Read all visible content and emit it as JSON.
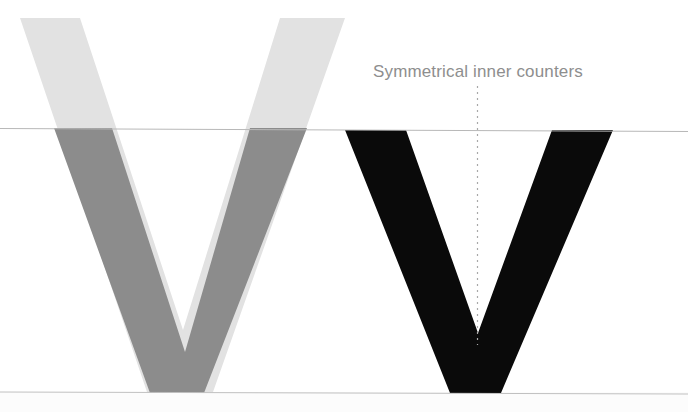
{
  "canvas": {
    "width": 688,
    "height": 412,
    "background": "#ffffff",
    "below_baseline_band": "#fcfcfc"
  },
  "annotation": {
    "label": "Symmetrical inner counters",
    "color": "#8e8e8e",
    "font_size_px": 17,
    "x": 373,
    "y": 61
  },
  "guides": {
    "cap_line": {
      "name": "cap-height-line",
      "y_left": 128.5,
      "y_right": 131.5,
      "color": "#b8b8b8",
      "stroke_width": 1
    },
    "base_line": {
      "name": "baseline",
      "y_left": 392.0,
      "y_right": 394.0,
      "color": "#c0c0c0",
      "stroke_width": 1
    },
    "center_axis": {
      "name": "vertical-symmetry-axis",
      "x": 477.5,
      "y_top": 86,
      "y_bottom": 345,
      "color": "#a8a8a8",
      "style": "dotted",
      "stroke_width": 1.2
    }
  },
  "glyphs": {
    "ghost_v": {
      "name": "ghost-outline-v",
      "description": "Light gray extended V rising above the cap line",
      "fill": "#e2e2e2",
      "points": "20,18 80,18 183,330 280,18 345,18 213,392 147,392"
    },
    "shadow_v": {
      "name": "overlay-comparison-v",
      "description": "Mid gray V clipped to the cap-height band, offset right of the ghost V",
      "fill": "#8c8c8c",
      "points": "54,128 112,128 185,352 250,128 307,128 204,393 150,393"
    },
    "solid_v": {
      "name": "final-solid-v",
      "description": "Black reference V sitting exactly on cap line and baseline",
      "fill": "#0a0a0a",
      "points": "345,130 406,130 478,333 552,130 613,130 501,393 450,393"
    }
  },
  "colors": {
    "ghost_gray": "#e2e2e2",
    "shadow_gray": "#8c8c8c",
    "solid_black": "#0a0a0a",
    "guide_gray": "#b8b8b8",
    "text_gray": "#8e8e8e"
  }
}
